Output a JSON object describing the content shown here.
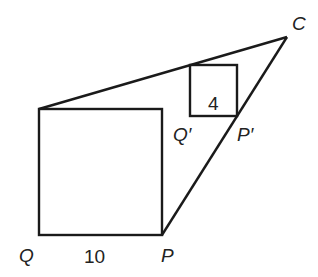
{
  "figure": {
    "type": "geometry-similar-squares",
    "labels": {
      "C": "C",
      "Q": "Q",
      "P": "P",
      "Q_prime": "Q′",
      "P_prime": "P′",
      "large_side": "10",
      "small_side": "4"
    },
    "points": {
      "C": [
        287,
        37
      ],
      "Q": [
        39,
        235
      ],
      "P": [
        162,
        235
      ],
      "large_top_left": [
        39,
        109
      ],
      "large_top_right": [
        162,
        109
      ],
      "Q_prime": [
        190,
        116
      ],
      "P_prime": [
        237,
        116
      ],
      "small_top_left": [
        190,
        65
      ],
      "small_top_right": [
        237,
        65
      ]
    },
    "stroke_color": "#1a1a1a",
    "background": "#ffffff"
  }
}
